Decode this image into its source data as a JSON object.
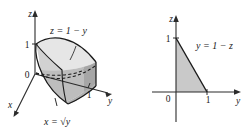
{
  "figure": {
    "panels": [
      {
        "id": "left-3d",
        "kind": "3d-solid",
        "axes": [
          {
            "name": "z",
            "label": "z",
            "direction": "up"
          },
          {
            "name": "y",
            "label": "y",
            "direction": "right"
          },
          {
            "name": "x",
            "label": "x",
            "direction": "down-left"
          }
        ],
        "tick_labels": {
          "z_one": "1",
          "origin": "0",
          "y_one": "1"
        },
        "surface_labels": [
          {
            "id": "top-plane",
            "text": "z = 1 − y"
          },
          {
            "id": "parabolic-cylinder",
            "text": "x = √y"
          }
        ]
      },
      {
        "id": "right-2d",
        "kind": "2d-region",
        "axes": [
          {
            "name": "z",
            "label": "z",
            "direction": "up"
          },
          {
            "name": "y",
            "label": "y",
            "direction": "right"
          }
        ],
        "tick_labels": {
          "z_one": "1",
          "origin": "0",
          "y_one": "1"
        },
        "boundary_labels": [
          {
            "id": "hypotenuse",
            "text": "y = 1 − z"
          }
        ]
      }
    ],
    "colors": {
      "ink": "#1a1a1a",
      "axis": "#2b2b2b",
      "fill_light": "#e3e3e3",
      "fill_mid": "#cfcfcf",
      "fill_dark": "#b4b4b4",
      "fill_darker": "#a2a2a2",
      "background": "#ffffff"
    }
  }
}
